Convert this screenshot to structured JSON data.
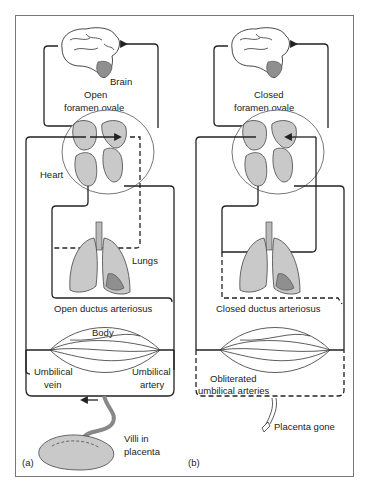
{
  "figure": {
    "panel_a": {
      "tag": "(a)",
      "labels": {
        "brain": "Brain",
        "foramen_line1": "Open",
        "foramen_line2": "foramen ovale",
        "heart": "Heart",
        "lungs": "Lungs",
        "ductus": "Open ductus arteriosus",
        "body": "Body",
        "umbilical_vein_line1": "Umbilical",
        "umbilical_vein_line2": "vein",
        "umbilical_artery_line1": "Umbilical",
        "umbilical_artery_line2": "artery",
        "placenta_line1": "Villi in",
        "placenta_line2": "placenta"
      }
    },
    "panel_b": {
      "tag": "(b)",
      "labels": {
        "foramen_line1": "Closed",
        "foramen_line2": "foramen ovale",
        "ductus": "Closed ductus arteriosus",
        "obliterated_line1": "Obliterated",
        "obliterated_line2": "umbilical arteries",
        "placenta_gone": "Placenta gone"
      }
    },
    "colors": {
      "organ_fill": "#c9c9c9",
      "organ_dark": "#8f8f8f",
      "line": "#222222",
      "frame": "#777777"
    }
  }
}
